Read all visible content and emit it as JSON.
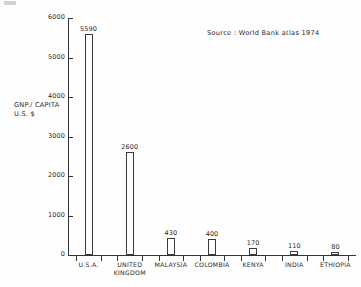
{
  "chart_data": {
    "type": "bar",
    "title": "",
    "xlabel": "",
    "ylabel_line1": "GNP./ CAPITA",
    "ylabel_line2": "U.S. $",
    "source_note": "Source : World Bank atlas 1974",
    "ylim": [
      0,
      6000
    ],
    "grid": false,
    "legend": "none",
    "y_ticks": [
      {
        "value": 6000,
        "label": "6000"
      },
      {
        "value": 5000,
        "label": "5000"
      },
      {
        "value": 4000,
        "label": "4000"
      },
      {
        "value": 3000,
        "label": "3000"
      },
      {
        "value": 2000,
        "label": "2000"
      },
      {
        "value": 1000,
        "label": "1000"
      },
      {
        "value": 0,
        "label": "0"
      }
    ],
    "categories": [
      "U.S.A.",
      "UNITED KINGDOM",
      "MALAYSIA",
      "COLOMBIA",
      "KENYA",
      "INDIA",
      "ETHIOPIA"
    ],
    "values": [
      5590,
      2600,
      430,
      400,
      170,
      110,
      80
    ],
    "bars": [
      {
        "category_line1": "U.S.A.",
        "category_line2": "",
        "value": 5590,
        "value_label": "5590"
      },
      {
        "category_line1": "UNITED",
        "category_line2": "KINGDOM",
        "value": 2600,
        "value_label": "2600"
      },
      {
        "category_line1": "MALAYSIA",
        "category_line2": "",
        "value": 430,
        "value_label": "430"
      },
      {
        "category_line1": "COLOMBIA",
        "category_line2": "",
        "value": 400,
        "value_label": "400"
      },
      {
        "category_line1": "KENYA",
        "category_line2": "",
        "value": 170,
        "value_label": "170"
      },
      {
        "category_line1": "INDIA",
        "category_line2": "",
        "value": 110,
        "value_label": "110"
      },
      {
        "category_line1": "ETHIOPIA",
        "category_line2": "",
        "value": 80,
        "value_label": "80"
      }
    ],
    "colors": {
      "background": "#fefefe",
      "axis": "#333333",
      "bar_outline": "#3a3a3a",
      "bar_fill": "#ffffff",
      "text": "#2a2a2a"
    }
  }
}
